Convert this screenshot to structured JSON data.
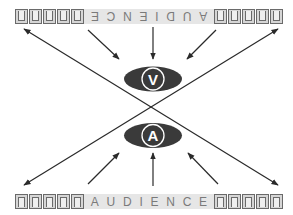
{
  "diagram": {
    "top_audience": {
      "label": "AUDIENCE",
      "letters": [
        "A",
        "U",
        "D",
        "I",
        "E",
        "N",
        "C",
        "E"
      ],
      "orientation": "rotated-180",
      "seats_left": 5,
      "seats_right": 5
    },
    "bottom_audience": {
      "label": "AUDIENCE",
      "letters": [
        "A",
        "U",
        "D",
        "I",
        "E",
        "N",
        "C",
        "E"
      ],
      "orientation": "upright",
      "seats_left": 5,
      "seats_right": 5
    },
    "nodes": {
      "top": {
        "letter": "V",
        "shape": "ellipse",
        "fill": "#3a3a3a"
      },
      "bottom": {
        "letter": "A",
        "shape": "ellipse",
        "fill": "#3a3a3a"
      }
    },
    "connections": [
      "top-audience arrows point down to V",
      "bottom-audience arrows point up to A",
      "two crossing diagonal double-headed arrows between corners"
    ],
    "colors": {
      "line": "#2a2a2a",
      "ellipse": "#3a3a3a",
      "seat_border": "#6a6a6a",
      "label_bg": "#e6e6e6",
      "label_text": "#7a7a7a"
    }
  }
}
